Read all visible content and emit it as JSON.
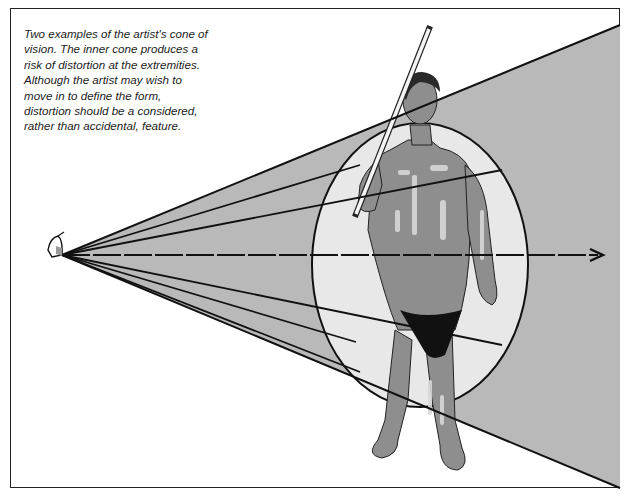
{
  "caption": {
    "lines": [
      "Two examples of the artist's cone of",
      "vision. The inner cone produces a",
      "risk of distortion at the extremities.",
      "Although the artist may wish to",
      "move in to define the form,",
      "distortion should be a considered,",
      "rather than accidental, feature."
    ]
  },
  "illustration": {
    "subject": "standing male figure holding a measuring rod",
    "eye_icon": "eye-icon",
    "sight_line": "dashed central line of sight with arrow",
    "outer_cone_color": "#b4b4b4",
    "inner_ellipse_color": "#e6e6e6",
    "figure_skin_color": "#8c8c8c",
    "garment_color": "#111111"
  }
}
